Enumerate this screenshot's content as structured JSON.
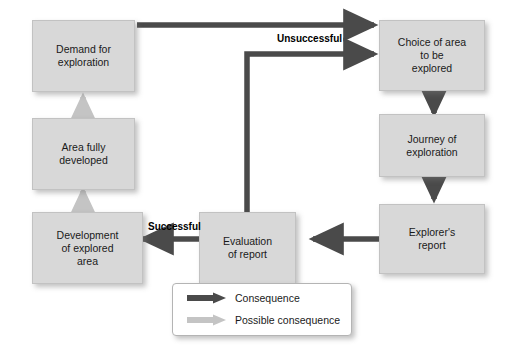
{
  "diagram": {
    "colors": {
      "node_fill": "#d8d8d8",
      "node_border": "#c2c2c2",
      "consequence_arrow": "#4a4a4a",
      "possible_consequence_arrow": "#c4c4c4",
      "background": "#ffffff",
      "text": "#1a1a1a"
    },
    "nodes": [
      {
        "id": "demand",
        "label": "Demand for\nexploration",
        "line1": "Demand for",
        "line2": "exploration",
        "line3": ""
      },
      {
        "id": "area_dev",
        "label": "Area fully\ndeveloped",
        "line1": "Area fully",
        "line2": "developed",
        "line3": ""
      },
      {
        "id": "development",
        "label": "Development\nof explored\narea",
        "line1": "Development",
        "line2": "of explored",
        "line3": "area"
      },
      {
        "id": "evaluation",
        "label": "Evaluation\nof report",
        "line1": "Evaluation",
        "line2": "of report",
        "line3": ""
      },
      {
        "id": "choice",
        "label": "Choice of area\nto be\nexplored",
        "line1": "Choice of area",
        "line2": "to be",
        "line3": "explored"
      },
      {
        "id": "journey",
        "label": "Journey of\nexploration",
        "line1": "Journey of",
        "line2": "exploration",
        "line3": ""
      },
      {
        "id": "explorer",
        "label": "Explorer's\nreport",
        "line1": "Explorer's",
        "line2": "report",
        "line3": ""
      }
    ],
    "edge_labels": {
      "unsuccessful": "Unsuccessful",
      "successful": "Successful"
    },
    "edges": [
      {
        "from": "demand",
        "to": "choice",
        "type": "consequence",
        "label": ""
      },
      {
        "from": "evaluation",
        "to": "choice",
        "type": "consequence",
        "label": "Unsuccessful"
      },
      {
        "from": "choice",
        "to": "journey",
        "type": "consequence",
        "label": ""
      },
      {
        "from": "journey",
        "to": "explorer",
        "type": "consequence",
        "label": ""
      },
      {
        "from": "explorer",
        "to": "evaluation",
        "type": "consequence",
        "label": ""
      },
      {
        "from": "evaluation",
        "to": "development",
        "type": "consequence",
        "label": "Successful"
      },
      {
        "from": "development",
        "to": "area_dev",
        "type": "possible_consequence",
        "label": ""
      },
      {
        "from": "area_dev",
        "to": "demand",
        "type": "possible_consequence",
        "label": ""
      }
    ]
  },
  "legend": {
    "items": [
      {
        "label": "Consequence",
        "arrow": "dark-arrow-icon",
        "color": "#4a4a4a"
      },
      {
        "label": "Possible consequence",
        "arrow": "light-arrow-icon",
        "color": "#c4c4c4"
      }
    ]
  }
}
